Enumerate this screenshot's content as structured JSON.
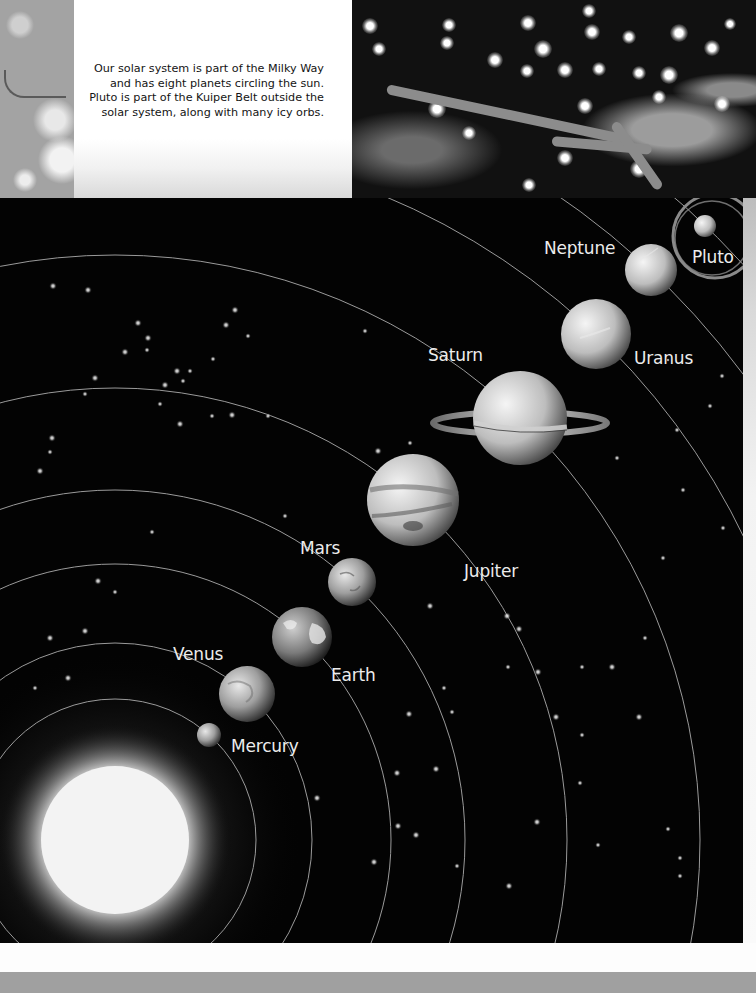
{
  "intro": {
    "text": "Our solar system is part of the Milky Way and has eight planets circling the sun. Pluto is part of the Kuiper Belt outside the solar system, along with many icy orbs."
  },
  "diagram": {
    "title": "Solar system",
    "colors": {
      "space": "#030303",
      "orbit": "#9a9a9a",
      "label": "#ececec",
      "highlight_ring": "#8a8a8a"
    },
    "sun": {
      "name": "Sun",
      "cx": 115,
      "cy": 642,
      "r": 78
    },
    "planets": [
      {
        "name": "Mercury",
        "label": "Mercury",
        "cx": 209,
        "cy": 537,
        "r": 12,
        "orbit_r": 141
      },
      {
        "name": "Venus",
        "label": "Venus",
        "cx": 247,
        "cy": 496,
        "r": 28,
        "orbit_r": 197
      },
      {
        "name": "Earth",
        "label": "Earth",
        "cx": 302,
        "cy": 439,
        "r": 30,
        "orbit_r": 276
      },
      {
        "name": "Mars",
        "label": "Mars",
        "cx": 352,
        "cy": 384,
        "r": 24,
        "orbit_r": 350
      },
      {
        "name": "Jupiter",
        "label": "Jupiter",
        "cx": 413,
        "cy": 302,
        "r": 46,
        "orbit_r": 452
      },
      {
        "name": "Saturn",
        "label": "Saturn",
        "cx": 520,
        "cy": 220,
        "r": 47,
        "orbit_r": 585
      },
      {
        "name": "Uranus",
        "label": "Uranus",
        "cx": 596,
        "cy": 136,
        "r": 35,
        "orbit_r": 698
      },
      {
        "name": "Neptune",
        "label": "Neptune",
        "cx": 651,
        "cy": 72,
        "r": 26,
        "orbit_r": 782
      },
      {
        "name": "Pluto",
        "label": "Pluto",
        "cx": 705,
        "cy": 28,
        "r": 11,
        "orbit_r": 852
      }
    ],
    "labels": {
      "mercury": "Mercury",
      "venus": "Venus",
      "earth": "Earth",
      "mars": "Mars",
      "jupiter": "Jupiter",
      "saturn": "Saturn",
      "uranus": "Uranus",
      "neptune": "Neptune",
      "pluto": "Pluto"
    }
  }
}
